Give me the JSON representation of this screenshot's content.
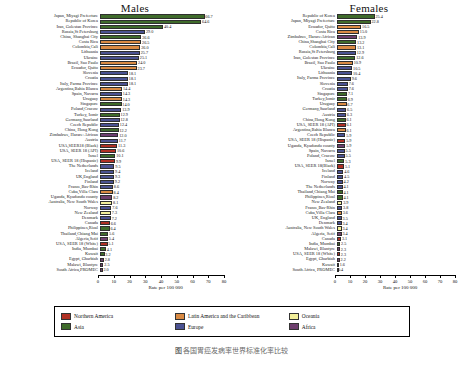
{
  "figure": {
    "caption_left": "图",
    "caption_blur": "各国胃癌发病率世界标准化率比较",
    "legend_title": ""
  },
  "legend": {
    "items": [
      {
        "label": "Northern America",
        "region": "northamerica",
        "color": "#b03024"
      },
      {
        "label": "Latin America and the Caribbean",
        "region": "latin",
        "color": "#d98a43"
      },
      {
        "label": "Oceania",
        "region": "oceania",
        "color": "#f2ef9a"
      },
      {
        "label": "Asia",
        "region": "asia",
        "color": "#3f6b2b"
      },
      {
        "label": "Europe",
        "region": "europe",
        "color": "#4b5292"
      },
      {
        "label": "Africa",
        "region": "africa",
        "color": "#6e3f6e"
      }
    ]
  },
  "chart_data": [
    {
      "type": "bar",
      "title": "Males",
      "xlabel": "Rate per 100 000",
      "ylabel": "",
      "xlim": [
        0,
        80
      ],
      "xticks": [
        0,
        10,
        20,
        30,
        40,
        50,
        60,
        70,
        80
      ],
      "orientation": "horizontal",
      "grid": false,
      "categories": [
        "Japan, Miyagi Prefecture",
        "Republic of Korea",
        "Iran, Golestan Province",
        "Russia,St Petersburg",
        "China, Shanghai City",
        "Costa Rica",
        "Colombia,Cali",
        "Lithuania",
        "Ukraine",
        "Brazil, Sao Paulo",
        "Ecuador, Quito",
        "Slovenia",
        "Croatia",
        "Italy, Parma Province",
        "Argentina,Bahia Blanca",
        "Spain, Navarra",
        "Uruguay",
        "Singapore",
        "Poland,Cracow",
        "Turkey, Izmir",
        "Germany,Saarland",
        "Czech Republic",
        "China, Hong Kong",
        "Zimbabwe, Harare: African",
        "Austria",
        "USA,SEER18 (Black)",
        "USA, SEER 18 (API)",
        "Israel",
        "USA, SEER 18 (Hispanic)",
        "The Netherlands",
        "Iceland",
        "UK,England",
        "Finland",
        "France,Bas-Rhin",
        "Cuba,Villa Clara",
        "Uganda, Kyadondo county",
        "Australia, New South Wales",
        "Norway",
        "New Zealand",
        "Denmark",
        "Canada",
        "Philippines,Rizal",
        "Thailand,Chiang Mai",
        "Algeria,Setif",
        "USA, SEER 18 (White)",
        "India, Mumbai",
        "Kuwait",
        "Egypt, Gharbiah",
        "Malawi, Blantyre",
        "South Africa,PROMEC"
      ],
      "values": [
        66.7,
        64.6,
        40.4,
        29.0,
        26.6,
        26.5,
        26.0,
        25.7,
        25.1,
        24.0,
        23.7,
        18.1,
        18.1,
        18.1,
        14.4,
        14.3,
        14.3,
        14.0,
        13.9,
        12.9,
        12.8,
        12.4,
        12.2,
        12.0,
        11.7,
        11.3,
        10.6,
        10.1,
        9.9,
        9.5,
        9.4,
        9.3,
        9.2,
        8.6,
        8.4,
        8.2,
        8.1,
        7.6,
        7.3,
        7.2,
        6.6,
        6.4,
        5.6,
        5.4,
        5.1,
        4.1,
        3.2,
        2.8,
        2.5,
        2.0
      ],
      "regions": [
        "asia",
        "asia",
        "asia",
        "europe",
        "asia",
        "latin",
        "latin",
        "europe",
        "europe",
        "latin",
        "latin",
        "europe",
        "europe",
        "europe",
        "latin",
        "europe",
        "latin",
        "asia",
        "europe",
        "asia",
        "europe",
        "europe",
        "asia",
        "africa",
        "europe",
        "northamerica",
        "northamerica",
        "asia",
        "northamerica",
        "europe",
        "europe",
        "europe",
        "europe",
        "europe",
        "latin",
        "africa",
        "oceania",
        "europe",
        "oceania",
        "europe",
        "northamerica",
        "asia",
        "asia",
        "africa",
        "northamerica",
        "asia",
        "asia",
        "africa",
        "africa",
        "africa"
      ]
    },
    {
      "type": "bar",
      "title": "Females",
      "xlabel": "Rate per 100 000",
      "ylabel": "",
      "xlim": [
        0,
        80
      ],
      "xticks": [
        0,
        10,
        20,
        30,
        40,
        50,
        60,
        70,
        80
      ],
      "orientation": "horizontal",
      "grid": false,
      "categories": [
        "Republic of Korea",
        "Japan, Miyagi Prefecture",
        "Ecuador, Quito",
        "Costa Rica",
        "Zimbabwe, Harare:African",
        "China,Shanghai City",
        "Colombia,Cali",
        "Russia,St Petersburg",
        "Iran, Golestan Province",
        "Brazil, Sao Paulo",
        "Ukraine",
        "Lithuania",
        "Italy, Parma Province",
        "Slovenia",
        "Croatia",
        "Singapore",
        "Turkey,Izmir",
        "Uruguay",
        "Germany,Saarland",
        "Austria",
        "China,Hong Kong",
        "USA, SEER 18 (API)",
        "Argentina,Bahia Blanca",
        "Czech Republic",
        "USA, SEER 18 (Hispanic)",
        "Uganda, Kyadondo county",
        "Spain, Navarra",
        "Poland, Cracow",
        "Israel",
        "USA, SEER 18(Black)",
        "Iceland",
        "Finland",
        "Norway",
        "The Netherlands",
        "Thailand,Chiang Mai",
        "Philippines,Rizal",
        "New Zealand",
        "France,Bas-Rhin",
        "Cuba,Villa Clara",
        "UK, England",
        "Denmark",
        "Australia, New South Wales",
        "Algeria, Setif",
        "Canada",
        "India, Mumbai",
        "Malawi, Blantyre",
        "USA, SEER 18 (White)",
        "Egypt, Gharbiah",
        "Kuwait",
        "South Africa, PROMEC"
      ],
      "values": [
        25.4,
        22.8,
        16.5,
        15.0,
        13.9,
        13.2,
        13.1,
        12.9,
        12.6,
        10.9,
        10.5,
        10.4,
        9.6,
        7.6,
        7.6,
        7.1,
        6.9,
        6.7,
        6.5,
        6.3,
        6.1,
        6.1,
        6.1,
        5.9,
        5.9,
        5.9,
        5.5,
        5.5,
        5.3,
        5.1,
        4.6,
        4.5,
        4.2,
        4.1,
        4.1,
        4.1,
        3.9,
        3.8,
        3.6,
        3.5,
        3.4,
        3.4,
        3.4,
        3.1,
        2.5,
        2.3,
        2.3,
        2.2,
        1.6,
        0.4
      ],
      "regions": [
        "asia",
        "asia",
        "latin",
        "latin",
        "africa",
        "asia",
        "latin",
        "europe",
        "asia",
        "latin",
        "europe",
        "europe",
        "europe",
        "europe",
        "europe",
        "asia",
        "asia",
        "latin",
        "europe",
        "europe",
        "asia",
        "northamerica",
        "latin",
        "europe",
        "northamerica",
        "africa",
        "europe",
        "europe",
        "asia",
        "northamerica",
        "europe",
        "europe",
        "europe",
        "europe",
        "asia",
        "asia",
        "oceania",
        "europe",
        "latin",
        "europe",
        "europe",
        "oceania",
        "africa",
        "northamerica",
        "asia",
        "africa",
        "northamerica",
        "africa",
        "asia",
        "africa"
      ]
    }
  ]
}
